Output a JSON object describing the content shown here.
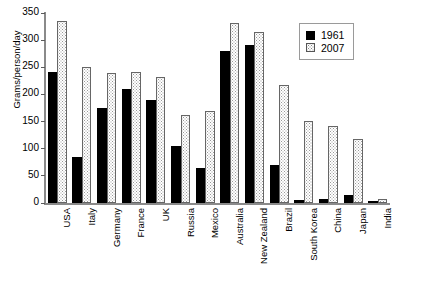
{
  "chart_data": {
    "type": "bar",
    "title": "",
    "subtitle": "",
    "xlabel": "",
    "ylabel": "Grams/person/day",
    "ylim": [
      0,
      350
    ],
    "yticks": [
      0,
      50,
      100,
      150,
      200,
      250,
      300,
      350
    ],
    "grid": false,
    "legend_position": "top-right",
    "categories": [
      "USA",
      "Italy",
      "Germany",
      "France",
      "UK",
      "Russia",
      "Mexico",
      "Australia",
      "New Zealand",
      "Brazil",
      "South Korea",
      "China",
      "Japan",
      "India"
    ],
    "series": [
      {
        "name": "1961",
        "color": "#000000",
        "pattern": "solid",
        "values": [
          242,
          84,
          175,
          210,
          190,
          105,
          65,
          280,
          292,
          70,
          6,
          8,
          15,
          4
        ]
      },
      {
        "name": "2007",
        "color": "#ffffff",
        "pattern": "dotted",
        "values": [
          335,
          250,
          240,
          241,
          232,
          163,
          170,
          332,
          315,
          218,
          151,
          142,
          118,
          8
        ]
      }
    ]
  },
  "legend": {
    "entries": [
      {
        "label": "1961"
      },
      {
        "label": "2007"
      }
    ]
  },
  "axis": {
    "y_title": "Grams/person/day"
  }
}
